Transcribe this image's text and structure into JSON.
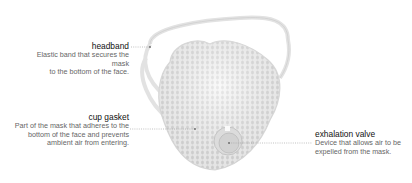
{
  "diagram": {
    "labels": [
      {
        "id": "headband",
        "title": "headband",
        "description_lines": [
          "Elastic band that secures the mask",
          "to the bottom of the face."
        ]
      },
      {
        "id": "cup-gasket",
        "title": "cup gasket",
        "description_lines": [
          "Part of the mask that adheres to the",
          "bottom of the face and prevents",
          "ambient air from entering."
        ]
      },
      {
        "id": "exhalation-valve",
        "title": "exhalation valve",
        "description_lines": [
          "Device that allows air to be",
          "expelled from the mask."
        ]
      }
    ],
    "colors": {
      "title": "#111111",
      "description": "#666666",
      "leader": "#999999",
      "mask": "#e4e4e4"
    }
  }
}
